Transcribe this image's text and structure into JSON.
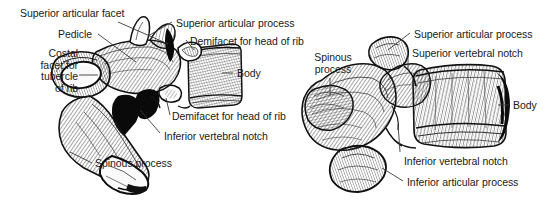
{
  "figure": {
    "background_color": "#ffffff",
    "ink_color": "#1a1a1a",
    "leader_color": "#3a3a3a",
    "width": 554,
    "height": 202
  },
  "panels": [
    {
      "id": "left-vertebra",
      "name": "thoracic-vertebra-lateral-left",
      "description": "Lateral view of a thoracic vertebra with long downward-sloping spinous process",
      "labels": [
        {
          "key": "superior-articular-facet",
          "text": "Superior articular facet",
          "align": "left",
          "x": 20,
          "y": 8,
          "lines": [
            "Superior articular facet"
          ]
        },
        {
          "key": "pedicle",
          "text": "Pedicle",
          "align": "left",
          "x": 58,
          "y": 29,
          "lines": [
            "Pedicle"
          ]
        },
        {
          "key": "costal-facet-for-tubercle-of-rib",
          "text": "Costal facet for tubercle of rib",
          "align": "right",
          "x": 22,
          "y": 48,
          "width": 56,
          "lines": [
            "Costal",
            "facet for",
            "tubercle",
            "of rib"
          ]
        },
        {
          "key": "superior-articular-process",
          "text": "Superior articular process",
          "align": "left",
          "x": 176,
          "y": 18,
          "lines": [
            "Superior articular process"
          ]
        },
        {
          "key": "demifacet-for-head-of-rib-superior",
          "text": "Demifacet for head of rib",
          "align": "left",
          "x": 190,
          "y": 36,
          "lines": [
            "Demifacet for head of rib"
          ]
        },
        {
          "key": "body",
          "text": "Body",
          "align": "left",
          "x": 237,
          "y": 68,
          "lines": [
            "Body"
          ]
        },
        {
          "key": "demifacet-for-head-of-rib-inferior",
          "text": "Demifacet for head of rib",
          "align": "left",
          "x": 172,
          "y": 111,
          "lines": [
            "Demifacet for head of rib"
          ]
        },
        {
          "key": "inferior-vertebral-notch",
          "text": "Inferior vertebral notch",
          "align": "left",
          "x": 164,
          "y": 131,
          "lines": [
            "Inferior vertebral notch"
          ]
        },
        {
          "key": "spinous-process",
          "text": "Spinous process",
          "align": "left",
          "x": 95,
          "y": 158,
          "lines": [
            "Spinous process"
          ]
        }
      ]
    },
    {
      "id": "right-vertebra",
      "name": "thoracic-vertebra-lateral-right",
      "description": "Lateral view of a thoracic vertebra with shorter spinous process",
      "labels": [
        {
          "key": "spinous-process",
          "text": "Spinous process",
          "align": "center",
          "x": 308,
          "y": 52,
          "width": 50,
          "lines": [
            "Spinous",
            "process"
          ]
        },
        {
          "key": "superior-articular-process",
          "text": "Superior articular process",
          "align": "left",
          "x": 414,
          "y": 29,
          "lines": [
            "Superior articular process"
          ]
        },
        {
          "key": "superior-vertebral-notch",
          "text": "Superior vertebral notch",
          "align": "left",
          "x": 412,
          "y": 48,
          "lines": [
            "Superior vertebral notch"
          ]
        },
        {
          "key": "body",
          "text": "Body",
          "align": "left",
          "x": 513,
          "y": 100,
          "lines": [
            "Body"
          ]
        },
        {
          "key": "inferior-vertebral-notch",
          "text": "Inferior vertebral notch",
          "align": "left",
          "x": 404,
          "y": 156,
          "lines": [
            "Inferior vertebral notch"
          ]
        },
        {
          "key": "inferior-articular-process",
          "text": "Inferior articular process",
          "align": "left",
          "x": 407,
          "y": 177,
          "lines": [
            "Inferior articular process"
          ]
        }
      ]
    }
  ]
}
